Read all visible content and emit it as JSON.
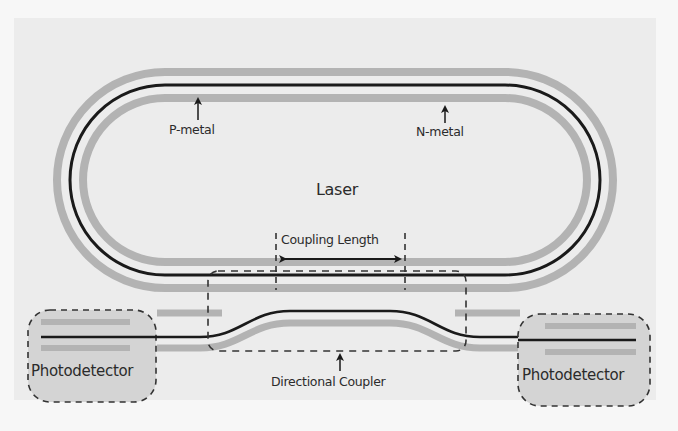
{
  "diagram": {
    "labels": {
      "p_metal": "P-metal",
      "n_metal": "N-metal",
      "laser": "Laser",
      "coupling_length": "Coupling Length",
      "directional_coupler": "Directional Coupler",
      "photodetector_left": "Photodetector",
      "photodetector_right": "Photodetector"
    },
    "colors": {
      "background_outer": "#f7f7f7",
      "panel": "#ececec",
      "metal_band": "#b3b3b3",
      "waveguide": "#1a1a1a",
      "photodetector_fill": "#d4d4d4",
      "dashed_outline": "#333333",
      "text": "#2b2b2b"
    },
    "components": [
      {
        "id": "laser-ring",
        "type": "racetrack-ring-waveguide"
      },
      {
        "id": "p-metal",
        "type": "metal-contact-band",
        "position": "outer"
      },
      {
        "id": "n-metal",
        "type": "metal-contact-band",
        "position": "inner"
      },
      {
        "id": "bus-waveguide",
        "type": "straight/s-bend waveguide"
      },
      {
        "id": "directional-coupler",
        "type": "dashed-region"
      },
      {
        "id": "photodetector-left",
        "type": "detector"
      },
      {
        "id": "photodetector-right",
        "type": "detector"
      }
    ],
    "annotations": [
      {
        "label": "P-metal",
        "arrow": "up",
        "target": "outer metal band"
      },
      {
        "label": "N-metal",
        "arrow": "up",
        "target": "inner metal band"
      },
      {
        "label": "Coupling Length",
        "arrow": "double-headed horizontal"
      },
      {
        "label": "Directional Coupler",
        "arrow": "up"
      }
    ]
  }
}
